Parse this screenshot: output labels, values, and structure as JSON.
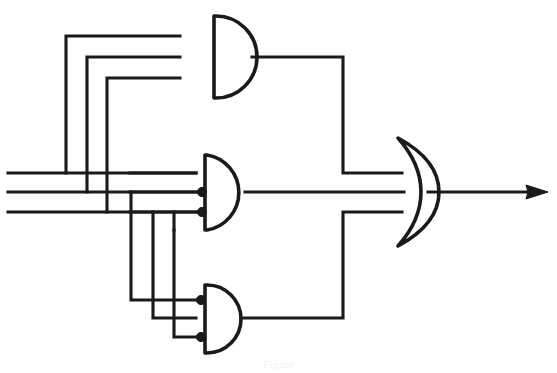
{
  "figure": {
    "caption": "Figure",
    "background_color": "#ffffff",
    "line_color": "#1a1a1a"
  },
  "inputs": {
    "label_a": "A",
    "label_b": "B",
    "label_c": "C",
    "rail_count": 3,
    "rails": [
      {
        "name": "input-rail-top",
        "y": 173,
        "x_start": 8,
        "x_end": 196
      },
      {
        "name": "input-rail-middle",
        "y": 192,
        "x_start": 8,
        "x_end": 196
      },
      {
        "name": "input-rail-bottom",
        "y": 212,
        "x_start": 8,
        "x_end": 196
      }
    ]
  },
  "gates": [
    {
      "id": "and-gate-top",
      "type": "AND",
      "symbol": "and-gate-icon",
      "inputs": 3,
      "cx": 213,
      "cy": 57,
      "radius": 40,
      "output_label": "",
      "input_ys": [
        35,
        57,
        79
      ]
    },
    {
      "id": "and-gate-middle",
      "type": "AND",
      "symbol": "and-gate-icon",
      "inputs": 3,
      "cx": 206,
      "cy": 192,
      "radius": 38,
      "output_label": "",
      "input_ys": [
        172,
        192,
        212
      ]
    },
    {
      "id": "and-gate-bottom",
      "type": "AND",
      "symbol": "and-gate-icon",
      "inputs": 3,
      "cx": 206,
      "cy": 318,
      "radius": 35,
      "output_label": "",
      "input_ys": [
        300,
        318,
        337
      ]
    },
    {
      "id": "or-gate-output",
      "type": "OR",
      "symbol": "or-gate-icon",
      "inputs": 3,
      "cx": 418,
      "cy": 192,
      "radius": 55,
      "output_label": "",
      "input_ys": [
        172,
        192,
        212
      ]
    }
  ],
  "output": {
    "name": "output-arrow",
    "symbol": "arrow-right-icon",
    "y": 192,
    "x_start": 432,
    "x_end": 540,
    "label": ""
  },
  "junction_dots": [
    {
      "name": "junction-dot-mid-1",
      "x": 197,
      "y": 192
    },
    {
      "name": "junction-dot-mid-2",
      "x": 197,
      "y": 212
    },
    {
      "name": "junction-dot-bot-1",
      "x": 197,
      "y": 300
    },
    {
      "name": "junction-dot-bot-2",
      "x": 197,
      "y": 337
    }
  ],
  "wires": {
    "top_gate_feed_1": "M 8 173 L 66 173 L 66 36 L 178 36",
    "top_gate_feed_2": "M 8 192 L 87 192 L 87 57 L 178 57",
    "top_gate_feed_3": "M 8 212 L 106 212 L 106 79 L 178 79",
    "top_gate_out": "M 250 57 L 342 57 L 342 173 L 398 173",
    "mid_gate_feed_1": "M 130 173 L 172 173",
    "mid_gate_feed_2": "M 130 192 L 196 192",
    "mid_gate_feed_3": "M 130 212 L 196 212",
    "mid_gate_out": "M 244 192 L 400 192",
    "bot_gate_feed_1": "M 130 225 L 130 300 L 196 300",
    "bot_gate_feed_2": "M 152 225 L 152 318 L 196 318",
    "bot_gate_feed_3": "M 174 240 L 174 337 L 196 337",
    "bot_gate_out": "M 241 318 L 342 318 L 342 212 L 398 212"
  }
}
